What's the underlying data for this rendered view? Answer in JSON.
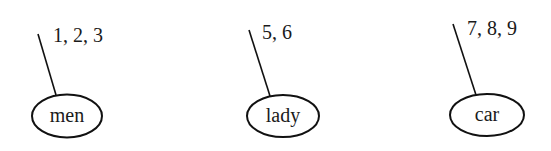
{
  "diagram": {
    "nodes": [
      {
        "label": "men",
        "annotation": "1, 2, 3",
        "cx": 67,
        "cy": 116,
        "rx": 35,
        "ry": 22,
        "line": [
          38,
          34,
          56,
          95
        ],
        "ax": 53,
        "ay": 42
      },
      {
        "label": "lady",
        "annotation": "5, 6",
        "cx": 283,
        "cy": 116,
        "rx": 36,
        "ry": 21,
        "line": [
          249,
          30,
          270,
          96
        ],
        "ax": 262,
        "ay": 39
      },
      {
        "label": "car",
        "annotation": "7, 8, 9",
        "cx": 487,
        "cy": 115,
        "rx": 37,
        "ry": 21,
        "line": [
          453,
          24,
          476,
          95
        ],
        "ax": 467,
        "ay": 35
      }
    ],
    "stroke_color": "#111111"
  }
}
